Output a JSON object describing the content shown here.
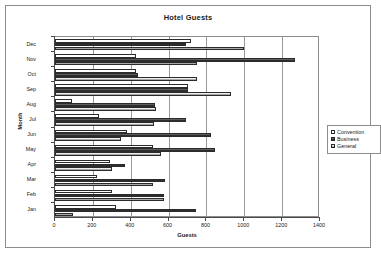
{
  "chart_data": {
    "type": "bar",
    "orientation": "horizontal",
    "title": "Hotel Guests",
    "xlabel": "Guests",
    "ylabel": "Month",
    "xlim": [
      0,
      1400
    ],
    "xticks": [
      0,
      200,
      400,
      600,
      800,
      1000,
      1200,
      1400
    ],
    "grid": true,
    "legend_position": "right",
    "categories": [
      "Jan",
      "Feb",
      "Mar",
      "Apr",
      "May",
      "Jun",
      "Jul",
      "Aug",
      "Sep",
      "Oct",
      "Nov",
      "Dec"
    ],
    "series": [
      {
        "name": "Convention",
        "values": [
          320,
          300,
          220,
          290,
          520,
          380,
          230,
          90,
          700,
          430,
          430,
          720
        ]
      },
      {
        "name": "Business",
        "values": [
          745,
          575,
          580,
          370,
          845,
          825,
          690,
          530,
          700,
          440,
          1270,
          690
        ]
      },
      {
        "name": "General",
        "values": [
          95,
          575,
          520,
          300,
          560,
          350,
          525,
          535,
          930,
          750,
          750,
          1000
        ]
      }
    ]
  },
  "legend": {
    "items": [
      {
        "label": "Convention",
        "swatch": "legend-swatch-convention"
      },
      {
        "label": "Business",
        "swatch": "legend-swatch-business"
      },
      {
        "label": "General",
        "swatch": "legend-swatch-general"
      }
    ]
  }
}
